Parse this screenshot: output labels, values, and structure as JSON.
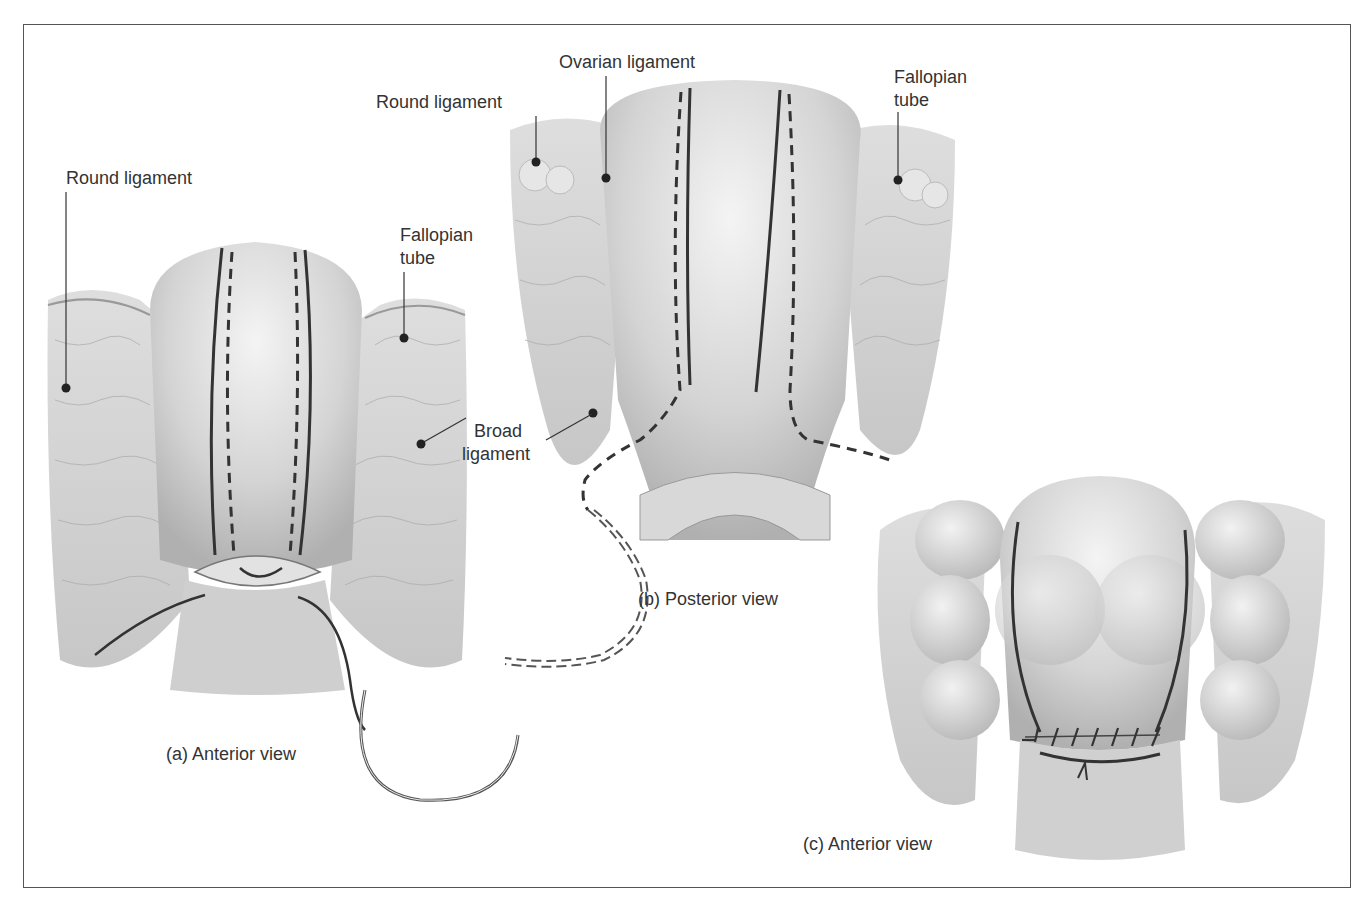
{
  "figure": {
    "panels": [
      {
        "id": "a",
        "caption": "(a)  Anterior view",
        "labels": {
          "round_ligament": "Round ligament",
          "fallopian_tube_line1": "Fallopian",
          "fallopian_tube_line2": "tube",
          "broad_ligament_line1": "Broad",
          "broad_ligament_line2": "ligament"
        }
      },
      {
        "id": "b",
        "caption": "(b)  Posterior view",
        "labels": {
          "round_ligament": "Round ligament",
          "ovarian_ligament": "Ovarian ligament",
          "fallopian_tube_line1": "Fallopian",
          "fallopian_tube_line2": "tube"
        }
      },
      {
        "id": "c",
        "caption": "(c)  Anterior view"
      }
    ],
    "colors": {
      "frame": "#555555",
      "tissue_light": "#e8e8e8",
      "tissue_mid": "#c9c9c9",
      "tissue_dark": "#a8a8a8",
      "incision_line": "#3a3a3a",
      "label_text": "#333333"
    }
  }
}
